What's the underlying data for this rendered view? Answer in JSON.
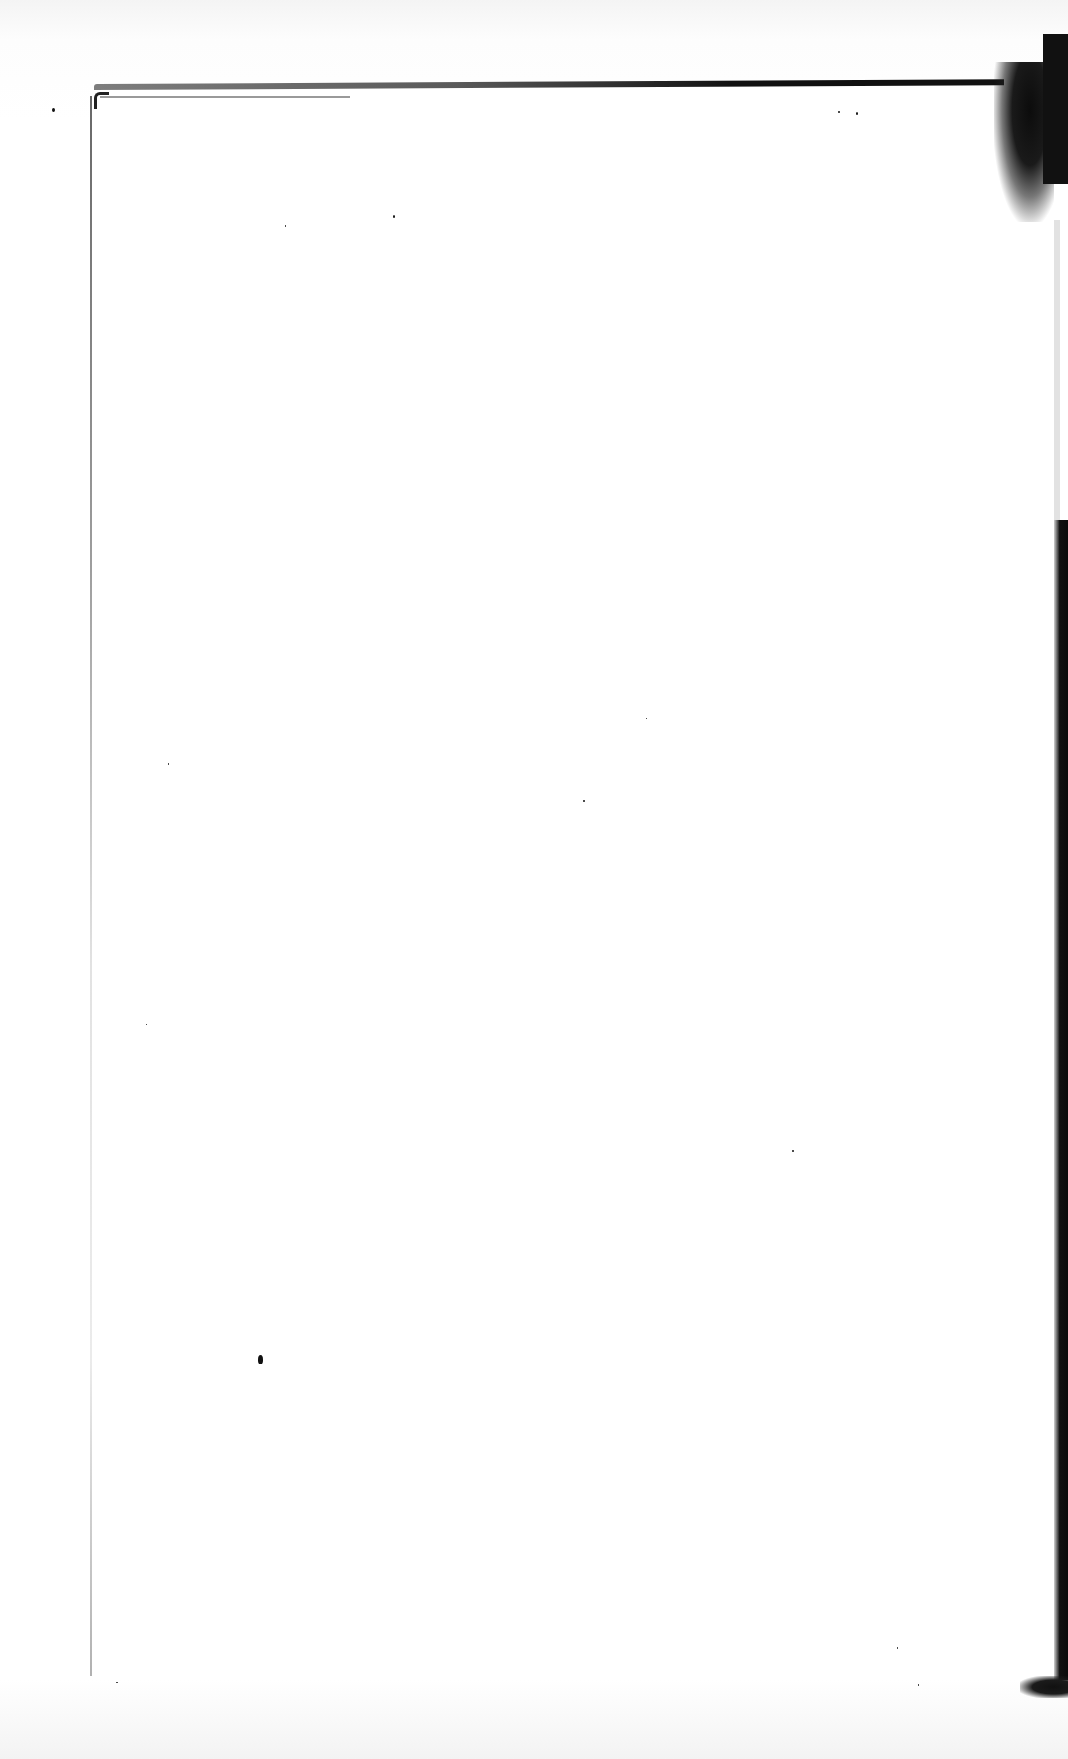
{
  "document": {
    "type": "scanned-page",
    "content": "blank",
    "text_blocks": []
  },
  "colors": {
    "page": "#ffffff",
    "background": "#fbfbfb",
    "border_ink": "#111111"
  }
}
